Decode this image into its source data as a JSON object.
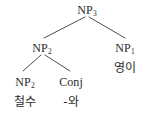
{
  "figure": {
    "kind": "syntax-tree",
    "background_color": "#ffffff",
    "text_color": "#2b2b2b",
    "line_color": "#3a3a3a"
  },
  "nodes": {
    "root": {
      "category": "NP",
      "subscript": "3"
    },
    "left_np": {
      "category": "NP",
      "subscript": "2"
    },
    "right_np": {
      "category": "NP",
      "subscript": "1"
    },
    "inner_left_np": {
      "category": "NP",
      "subscript": "2"
    },
    "conj": {
      "category": "Conj",
      "subscript": ""
    }
  },
  "terminals": {
    "left_word": "철수",
    "conj_word": "-와",
    "right_word": "영이"
  }
}
